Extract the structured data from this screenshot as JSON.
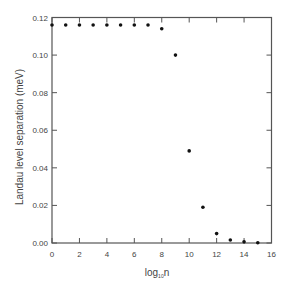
{
  "chart_data": {
    "type": "scatter",
    "title": "",
    "xlabel": "log10 n",
    "xlabel_main": "log",
    "xlabel_sub": "10",
    "xlabel_tail": "n",
    "ylabel": "Landau level separation (meV)",
    "xlim": [
      0,
      16
    ],
    "ylim": [
      0.0,
      0.12
    ],
    "xticks": [
      0,
      2,
      4,
      6,
      8,
      10,
      12,
      14,
      16
    ],
    "yticks": [
      0.0,
      0.02,
      0.04,
      0.06,
      0.08,
      0.1,
      0.12
    ],
    "ytick_labels": [
      "0.00",
      "0.02",
      "0.04",
      "0.06",
      "0.08",
      "0.10",
      "0.12"
    ],
    "grid": false,
    "legend": null,
    "marker_color": "#111111",
    "axis_color": "#555555",
    "series": [
      {
        "name": "Landau level separation",
        "x": [
          0,
          1,
          2,
          3,
          4,
          5,
          6,
          7,
          8,
          9,
          10,
          11,
          12,
          13,
          14,
          15
        ],
        "y": [
          0.116,
          0.116,
          0.116,
          0.116,
          0.116,
          0.116,
          0.116,
          0.116,
          0.114,
          0.1,
          0.049,
          0.019,
          0.005,
          0.0016,
          0.0006,
          0.0001
        ]
      }
    ]
  }
}
